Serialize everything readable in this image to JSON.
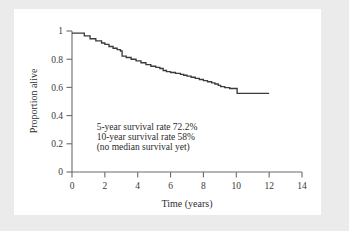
{
  "figure": {
    "background_color": "#ebebeb",
    "panel_color": "#ffffff",
    "line_color": "#3b3b3b",
    "axis_color": "#6b6b6b",
    "text_color": "#2e2e2e"
  },
  "chart_data": {
    "type": "line",
    "title": "",
    "subtitle": "",
    "xlabel": "Time (years)",
    "ylabel": "Proportion alive",
    "xlim": [
      0,
      14
    ],
    "ylim": [
      0,
      1
    ],
    "xticks": [
      0,
      2,
      4,
      6,
      8,
      10,
      12,
      14
    ],
    "xticklabels": [
      "0",
      "2",
      "4",
      "6",
      "8",
      "10",
      "12",
      "14"
    ],
    "yticks": [
      0,
      0.2,
      0.4,
      0.6,
      0.8,
      1
    ],
    "yticklabels": [
      "0",
      "0.2",
      "0.4",
      "0.6",
      "0.8",
      "1"
    ],
    "grid": false,
    "legend": null,
    "legend_position": "none",
    "drawstyle": "steps-post",
    "series": [
      {
        "name": "Survival",
        "x": [
          0.0,
          0.55,
          0.75,
          1.1,
          1.45,
          1.8,
          2.0,
          2.25,
          2.5,
          2.75,
          2.95,
          3.05,
          3.3,
          3.6,
          3.9,
          4.2,
          4.5,
          4.8,
          5.1,
          5.35,
          5.55,
          5.75,
          6.0,
          6.3,
          6.6,
          6.8,
          7.0,
          7.25,
          7.5,
          7.75,
          8.0,
          8.25,
          8.5,
          8.7,
          8.9,
          9.05,
          9.3,
          9.6,
          9.95,
          10.05,
          12.0
        ],
        "y": [
          0.985,
          0.985,
          0.965,
          0.945,
          0.93,
          0.915,
          0.905,
          0.89,
          0.878,
          0.868,
          0.858,
          0.822,
          0.812,
          0.8,
          0.788,
          0.775,
          0.762,
          0.75,
          0.742,
          0.734,
          0.72,
          0.712,
          0.706,
          0.7,
          0.692,
          0.686,
          0.68,
          0.672,
          0.664,
          0.656,
          0.648,
          0.64,
          0.632,
          0.624,
          0.614,
          0.606,
          0.598,
          0.592,
          0.592,
          0.558,
          0.558
        ]
      }
    ],
    "annotations": [
      {
        "id": "annot-5yr",
        "text": "5-year survival rate 72.2%",
        "x": 1.5,
        "y": 0.295
      },
      {
        "id": "annot-10yr",
        "text": "10-year survival rate 58%",
        "x": 1.5,
        "y": 0.225
      },
      {
        "id": "annot-median",
        "text": "(no median survival yet)",
        "x": 1.5,
        "y": 0.155
      }
    ]
  }
}
